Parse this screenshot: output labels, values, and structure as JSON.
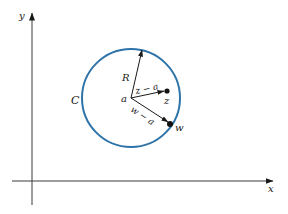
{
  "diagram": {
    "type": "complex-plane-circle",
    "axes": {
      "x_label": "x",
      "y_label": "y"
    },
    "circle": {
      "label": "C",
      "center_label": "a",
      "radius_label": "R",
      "color": "#2f74a8"
    },
    "points": {
      "z": {
        "label": "z",
        "vector_label": "z − a"
      },
      "w": {
        "label": "w",
        "vector_label": "w − a"
      }
    }
  }
}
